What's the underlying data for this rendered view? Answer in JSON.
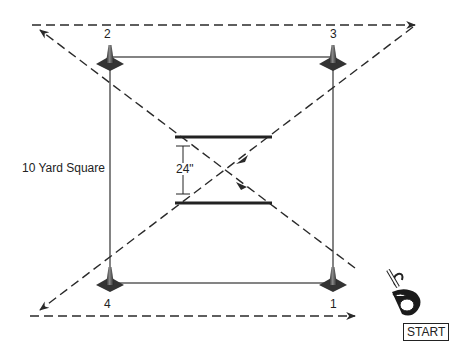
{
  "diagram": {
    "title_label": "10 Yard Square",
    "gate_width_label": "24\"",
    "start_label": "START",
    "cones": [
      {
        "id": "1",
        "label": "1",
        "x": 333,
        "y": 283
      },
      {
        "id": "2",
        "label": "2",
        "x": 110,
        "y": 57
      },
      {
        "id": "3",
        "label": "3",
        "x": 333,
        "y": 57
      },
      {
        "id": "4",
        "label": "4",
        "x": 110,
        "y": 283
      }
    ],
    "square": {
      "x1": 110,
      "y1": 57,
      "x2": 333,
      "y2": 283
    },
    "paths": [
      {
        "name": "bottom-dashed-run",
        "from": [
          30,
          316
        ],
        "to": [
          355,
          316
        ],
        "arrow": "end"
      },
      {
        "name": "diagonal-1-to-2",
        "from": [
          355,
          268
        ],
        "to": [
          40,
          30
        ],
        "arrow": "end"
      },
      {
        "name": "top-dashed-run",
        "from": [
          32,
          25
        ],
        "to": [
          415,
          25
        ],
        "arrow": "end"
      },
      {
        "name": "diagonal-3-to-4",
        "from": [
          415,
          25
        ],
        "to": [
          40,
          310
        ],
        "arrow": "end"
      }
    ],
    "gate": {
      "x1": 175,
      "x2": 272,
      "y_top": 137,
      "y_bottom": 203
    },
    "colors": {
      "line": "#2a2a2a",
      "cone": "#444444",
      "background": "#ffffff"
    }
  }
}
